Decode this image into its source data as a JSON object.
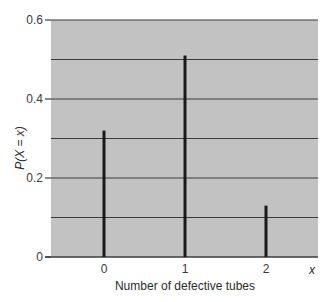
{
  "chart_data": {
    "type": "bar",
    "title": "",
    "xlabel": "Number of defective tubes",
    "ylabel": "P(X = x)",
    "x_axis_symbol": "x",
    "categories": [
      "0",
      "1",
      "2"
    ],
    "values": [
      0.32,
      0.51,
      0.13
    ],
    "ylim": [
      0,
      0.6
    ],
    "yticks": [
      0,
      0.2,
      0.4,
      0.6
    ],
    "ytick_labels": [
      "0",
      "0.2",
      "0.4",
      "0.6"
    ],
    "gridlines": [
      0.1,
      0.2,
      0.3,
      0.4,
      0.5,
      0.6
    ],
    "grid": true,
    "legend": null,
    "bar_style": "thin vertical lines (spike plot)"
  },
  "colors": {
    "plot_background": "#c2c2c2",
    "gridline": "#3c3c3c",
    "bar": "#1a1a1a",
    "text": "#2a2a2a"
  }
}
